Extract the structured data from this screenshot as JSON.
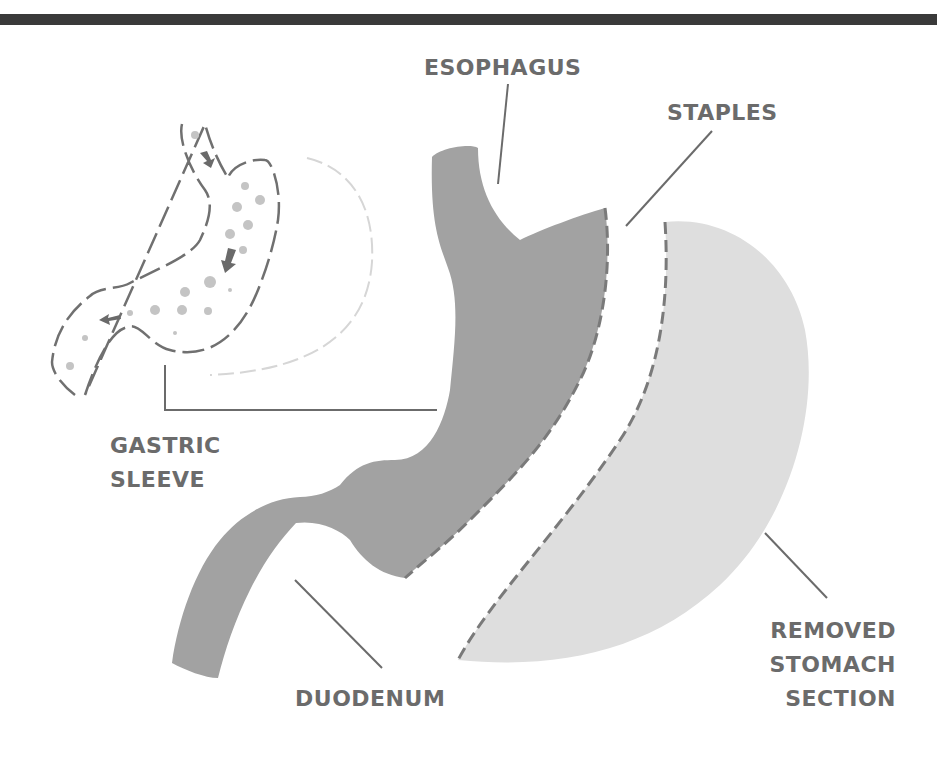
{
  "header": {
    "cropped_text": "",
    "rule_color": "#3a3a3a"
  },
  "diagram": {
    "colors": {
      "sleeve": "#9e9e9e",
      "removed": "#dcdcdc",
      "label": "#6b6b6b",
      "staple": "#7a7a7a"
    },
    "labels": {
      "esophagus": "ESOPHAGUS",
      "staples": "STAPLES",
      "gastric_sleeve_1": "GASTRIC",
      "gastric_sleeve_2": "SLEEVE",
      "duodenum": "DUODENUM",
      "removed_1": "REMOVED",
      "removed_2": "STOMACH",
      "removed_3": "SECTION"
    },
    "inset": {
      "description": "outline of sleeve stomach with food particles and flow arrows",
      "arrows": 3
    }
  }
}
